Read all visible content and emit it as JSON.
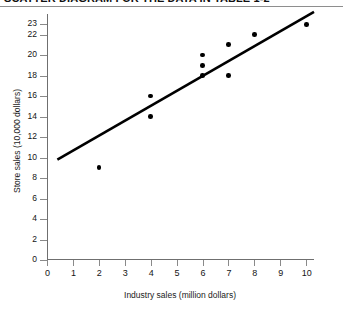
{
  "header": {
    "caption": "SCATTER DIAGRAM FOR THE DATA IN TABLE 1-2"
  },
  "chart_data": {
    "type": "scatter",
    "title": "",
    "xlabel": "Industry sales (million dollars)",
    "ylabel": "Store sales (10,000 dollars)",
    "xlim": [
      0,
      10.3
    ],
    "ylim": [
      0,
      24
    ],
    "grid": false,
    "legend": "none",
    "marker_color": "#000000",
    "line_color": "#000000",
    "axis_color": "#6f6f6f",
    "xticks": [
      0,
      1,
      2,
      3,
      4,
      5,
      6,
      7,
      8,
      9,
      10
    ],
    "xtick_labels": [
      "0",
      "1",
      "2",
      "3",
      "4",
      "5",
      "6",
      "7",
      "8",
      "9",
      "10"
    ],
    "yticks": [
      0,
      2,
      4,
      6,
      8,
      10,
      12,
      14,
      16,
      18,
      20,
      22,
      23
    ],
    "ytick_labels": [
      "0",
      "2",
      "4",
      "6",
      "8",
      "10",
      "12",
      "14",
      "16",
      "18",
      "20",
      "22",
      "23"
    ],
    "points": [
      {
        "x": 2,
        "y": 9
      },
      {
        "x": 4,
        "y": 16
      },
      {
        "x": 4,
        "y": 14
      },
      {
        "x": 6,
        "y": 20
      },
      {
        "x": 6,
        "y": 19
      },
      {
        "x": 6,
        "y": 18
      },
      {
        "x": 7,
        "y": 21
      },
      {
        "x": 7,
        "y": 18
      },
      {
        "x": 8,
        "y": 22
      },
      {
        "x": 10,
        "y": 23
      }
    ],
    "trendline": {
      "label": "regression line",
      "x0": 0.4,
      "y0": 9.8,
      "x1": 10.3,
      "y1": 24.2
    }
  }
}
